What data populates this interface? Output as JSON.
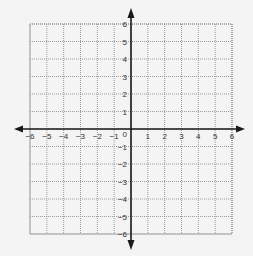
{
  "diagram": {
    "type": "coordinate-plane",
    "x_axis": {
      "min": -6,
      "max": 6,
      "tick_labels": [
        "-6",
        "-5",
        "-4",
        "-3",
        "-2",
        "-1",
        "1",
        "2",
        "3",
        "4",
        "5",
        "6"
      ],
      "has_arrows": true
    },
    "y_axis": {
      "min": -6,
      "max": 6,
      "tick_labels": [
        "6",
        "5",
        "4",
        "3",
        "2",
        "1",
        "-1",
        "-2",
        "-3",
        "-4",
        "-5",
        "-6"
      ],
      "has_arrows": true
    },
    "origin_label": "0",
    "grid": {
      "visible": true,
      "step": 1,
      "style": "dotted"
    },
    "colors": {
      "background": "#f4f4f4",
      "axis": "#1a1a1a",
      "grid": "#9a9a9a",
      "label": "#333333"
    }
  }
}
